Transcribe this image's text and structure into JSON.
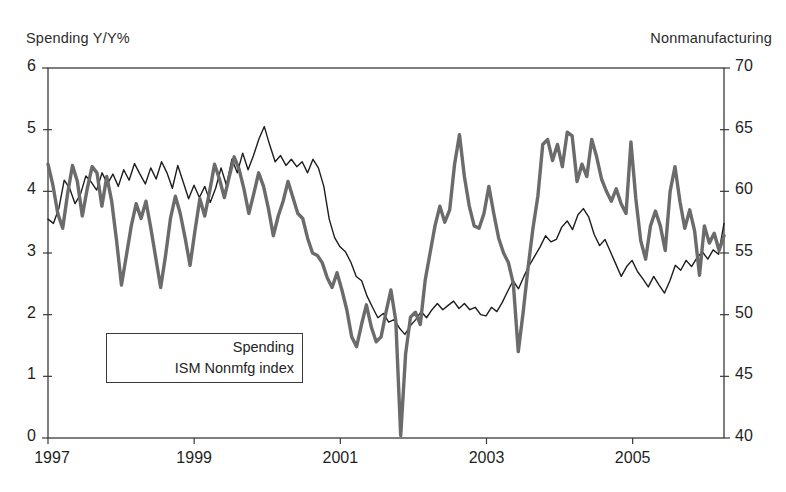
{
  "chart_data": {
    "type": "line",
    "title": "",
    "xlabel": "",
    "left_axis_label": "Spending Y/Y%",
    "right_axis_label": "Nonmanufacturing",
    "grid": false,
    "legend_position": "inside-lower-left",
    "xlim": [
      1997.0,
      2006.25
    ],
    "xticks": [
      1997,
      1999,
      2001,
      2003,
      2005
    ],
    "xtick_labels": [
      "1997",
      "1999",
      "2001",
      "2003",
      "2005"
    ],
    "left_ylim": [
      0,
      6
    ],
    "left_yticks": [
      0,
      1,
      2,
      3,
      4,
      5,
      6
    ],
    "left_ytick_labels": [
      "0",
      "1",
      "2",
      "3",
      "4",
      "5",
      "6"
    ],
    "right_ylim": [
      40,
      70
    ],
    "right_yticks": [
      40,
      45,
      50,
      55,
      60,
      65,
      70
    ],
    "right_ytick_labels": [
      "40",
      "45",
      "50",
      "55",
      "60",
      "65",
      "70"
    ],
    "series": [
      {
        "name": "Spending",
        "axis": "left",
        "color": "#1d1d1d",
        "width": 1.4,
        "values": [
          3.55,
          3.48,
          3.72,
          4.18,
          4.05,
          3.8,
          3.95,
          4.25,
          4.15,
          4.02,
          4.3,
          4.12,
          4.28,
          4.08,
          4.35,
          4.18,
          4.45,
          4.28,
          4.12,
          4.38,
          4.2,
          4.48,
          4.3,
          4.05,
          4.42,
          4.15,
          3.88,
          4.1,
          3.9,
          4.08,
          3.82,
          4.05,
          4.38,
          4.1,
          4.52,
          4.3,
          4.62,
          4.35,
          4.58,
          4.85,
          5.05,
          4.75,
          4.48,
          4.58,
          4.42,
          4.52,
          4.4,
          4.48,
          4.3,
          4.52,
          4.38,
          4.08,
          3.55,
          3.25,
          3.1,
          3.02,
          2.85,
          2.62,
          2.55,
          2.3,
          2.12,
          1.95,
          2.02,
          1.88,
          1.92,
          1.78,
          1.68,
          1.82,
          1.92,
          2.05,
          1.95,
          2.08,
          2.18,
          2.08,
          2.15,
          2.22,
          2.1,
          2.18,
          2.08,
          2.12,
          2.0,
          1.98,
          2.12,
          2.05,
          2.2,
          2.38,
          2.55,
          2.42,
          2.62,
          2.8,
          2.95,
          3.1,
          3.28,
          3.18,
          3.22,
          3.42,
          3.52,
          3.38,
          3.62,
          3.72,
          3.58,
          3.3,
          3.12,
          3.22,
          3.02,
          2.82,
          2.62,
          2.78,
          2.88,
          2.7,
          2.58,
          2.45,
          2.62,
          2.48,
          2.35,
          2.55,
          2.8,
          2.72,
          2.88,
          2.78,
          2.92,
          3.02,
          2.9,
          3.05,
          2.98,
          3.48
        ]
      },
      {
        "name": "ISM Nonmfg index",
        "axis": "right",
        "color": "#6b6b6b",
        "width": 3.4,
        "values": [
          62.2,
          60.5,
          58.2,
          57.0,
          59.8,
          62.1,
          60.8,
          58.0,
          60.2,
          62.0,
          61.5,
          58.8,
          61.2,
          59.2,
          56.0,
          52.4,
          54.8,
          57.2,
          59.0,
          57.8,
          59.2,
          57.0,
          54.6,
          52.2,
          54.8,
          57.8,
          59.6,
          58.2,
          56.2,
          54.0,
          56.8,
          59.4,
          58.0,
          60.0,
          62.2,
          61.0,
          59.5,
          61.2,
          62.8,
          61.8,
          60.2,
          58.2,
          59.8,
          61.5,
          60.4,
          58.6,
          56.4,
          58.0,
          59.2,
          60.8,
          59.5,
          58.2,
          57.8,
          56.2,
          55.0,
          54.8,
          54.2,
          53.0,
          52.2,
          53.4,
          52.0,
          50.4,
          48.2,
          47.4,
          49.2,
          50.8,
          49.0,
          47.8,
          48.2,
          50.2,
          52.0,
          49.5,
          40.2,
          46.8,
          49.8,
          50.2,
          49.2,
          52.8,
          55.0,
          57.2,
          58.8,
          57.5,
          58.5,
          62.2,
          64.6,
          61.2,
          58.8,
          57.2,
          57.0,
          58.2,
          60.4,
          58.2,
          56.2,
          55.0,
          54.2,
          52.5,
          47.0,
          50.2,
          53.8,
          57.0,
          59.6,
          63.8,
          64.2,
          62.5,
          63.8,
          62.0,
          64.8,
          64.5,
          60.8,
          62.2,
          61.2,
          64.2,
          62.8,
          61.0,
          60.0,
          59.2,
          60.2,
          59.0,
          58.2,
          64.0,
          59.4,
          56.0,
          54.5,
          57.2,
          58.4,
          57.2,
          55.2,
          60.0,
          62.0,
          59.2,
          57.0,
          58.5,
          56.8,
          53.2,
          57.2,
          55.8,
          56.6,
          55.2,
          56.4
        ]
      }
    ]
  },
  "plot_geometry": {
    "left": 48,
    "top": 68,
    "right": 724,
    "bottom": 438
  }
}
